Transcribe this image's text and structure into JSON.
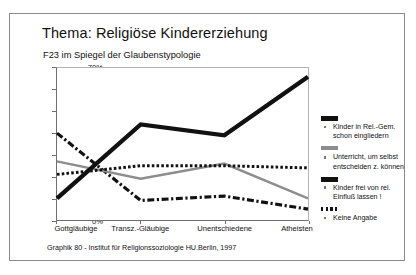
{
  "chart_data": {
    "type": "line",
    "title": "Thema: Religiöse Kindererziehung",
    "subtitle": "F23 im Spiegel der Glaubenstypologie",
    "xlabel": "",
    "ylabel": "",
    "ylim": [
      0,
      70
    ],
    "ytick_labels": [
      "0%",
      "10%",
      "20%",
      "30%",
      "40%",
      "50%",
      "60%",
      "70%"
    ],
    "ytick_values": [
      0,
      10,
      20,
      30,
      40,
      50,
      60,
      70
    ],
    "grid": false,
    "legend_position": "right",
    "categories": [
      "Gottgläubige",
      "Transz.-Gläubige",
      "Unentschiedene",
      "Atheisten"
    ],
    "series": [
      {
        "name": "Kinder in Rel.-Gem. schon eingliedern",
        "style": "dash-dot",
        "color": "#111111",
        "values": [
          40,
          9,
          11,
          5
        ]
      },
      {
        "name": "Unterricht, um selbst entscheiden z. können",
        "style": "solid-gray",
        "color": "#8d8d8d",
        "values": [
          27,
          19,
          26,
          10
        ]
      },
      {
        "name": "Kinder frei von rel. Einfluß lassen !",
        "style": "solid-thick",
        "color": "#111111",
        "values": [
          10,
          44,
          39,
          66
        ]
      },
      {
        "name": "Keine Angabe",
        "style": "dotted",
        "color": "#111111",
        "values": [
          21,
          25,
          25,
          24
        ]
      }
    ],
    "footer": "Graphik 80  -  Institut für Religionssoziologie HU.Berlin, 1997"
  },
  "legend": {
    "entries": [
      {
        "label_line1": "Kinder in Rel.-Gem.",
        "label_line2": "schon eingliedern"
      },
      {
        "label_line1": "Unterricht, um selbst",
        "label_line2": "entscheiden z. können"
      },
      {
        "label_line1": "Kinder frei von rel.",
        "label_line2": "Einfluß lassen !"
      },
      {
        "label_line1": "Keine Angabe",
        "label_line2": ""
      }
    ]
  }
}
